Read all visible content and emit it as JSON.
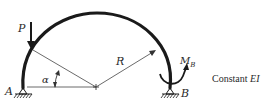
{
  "diagram": {
    "labels": {
      "load": "P",
      "angle": "α",
      "radius": "R",
      "moment": "M",
      "moment_sub": "B",
      "support_left": "A",
      "support_right": "B"
    },
    "note": {
      "prefix": "Constant ",
      "property": "EI"
    },
    "colors": {
      "stroke": "#1a1a1a",
      "thin": "#444444",
      "background": "#ffffff"
    }
  }
}
